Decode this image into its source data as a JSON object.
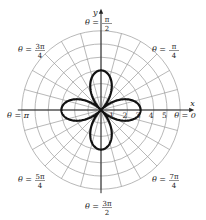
{
  "chart_data": {
    "type": "line",
    "subtype": "polar",
    "title": "",
    "equation": "r = 3cos(2θ)",
    "origin_px": [
      101,
      110
    ],
    "unit_px": 13.2,
    "rings": [
      1,
      2,
      3,
      4,
      5,
      6
    ],
    "radial_line_step_deg": 15,
    "r_tick_labels": [
      "1",
      "2",
      "3",
      "4",
      "5"
    ],
    "axis_labels": {
      "x": "x",
      "y": "y"
    },
    "angle_labels": [
      {
        "text": "θ = 0",
        "num": "0",
        "den": "",
        "angle_deg": 0
      },
      {
        "text": "θ = π/4",
        "num": "π",
        "den": "4",
        "angle_deg": 45
      },
      {
        "text": "θ = π/2",
        "num": "π",
        "den": "2",
        "angle_deg": 90
      },
      {
        "text": "θ = 3π/4",
        "num": "3π",
        "den": "4",
        "angle_deg": 135
      },
      {
        "text": "θ = π",
        "num": "π",
        "den": "",
        "angle_deg": 180
      },
      {
        "text": "θ = 5π/4",
        "num": "5π",
        "den": "4",
        "angle_deg": 225
      },
      {
        "text": "θ = 3π/2",
        "num": "3π",
        "den": "2",
        "angle_deg": 270
      },
      {
        "text": "θ = 7π/4",
        "num": "7π",
        "den": "4",
        "angle_deg": 315
      }
    ],
    "series": [
      {
        "name": "r = 3cos 2θ",
        "amplitude": 3,
        "k": 2,
        "color": "#111111",
        "stroke_width": 2.2
      }
    ],
    "colors": {
      "grid": "#9a9a9a",
      "axis": "#222222",
      "curve": "#111111"
    }
  }
}
